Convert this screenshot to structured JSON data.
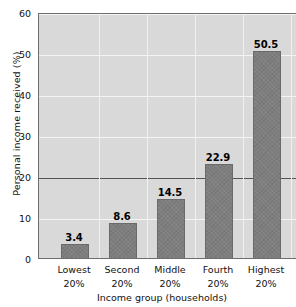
{
  "chart_data": {
    "type": "bar",
    "title": "",
    "subtitle": "",
    "xlabel": "Income group (households)",
    "ylabel": "Personal income received (%)",
    "categories": [
      "Lowest 20%",
      "Second 20%",
      "Middle 20%",
      "Fourth 20%",
      "Highest 20%"
    ],
    "category_lines": [
      [
        "Lowest",
        "20%"
      ],
      [
        "Second",
        "20%"
      ],
      [
        "Middle",
        "20%"
      ],
      [
        "Fourth",
        "20%"
      ],
      [
        "Highest",
        "20%"
      ]
    ],
    "values": [
      3.4,
      8.6,
      14.5,
      22.9,
      50.5
    ],
    "value_labels": [
      "3.4",
      "8.6",
      "14.5",
      "22.9",
      "50.5"
    ],
    "ylim": [
      0,
      60
    ],
    "ytick_labels": [
      "0",
      "10",
      "20",
      "30",
      "40",
      "50",
      "60"
    ],
    "ytick_values": [
      0,
      10,
      20,
      30,
      40,
      50,
      60
    ],
    "grid": "both",
    "legend": "none",
    "reference_line": 20,
    "colors": {
      "bar_fill": "#7e7e7e",
      "bar_edge": "#6a6a6a",
      "plot_background": "#d9d9d9",
      "gridline": "#f4f4f4",
      "reference_line": "#555555",
      "axis_border": "#6e6e6e",
      "text": "#111111",
      "value_label": "#000000",
      "page_background": "#ffffff"
    }
  }
}
